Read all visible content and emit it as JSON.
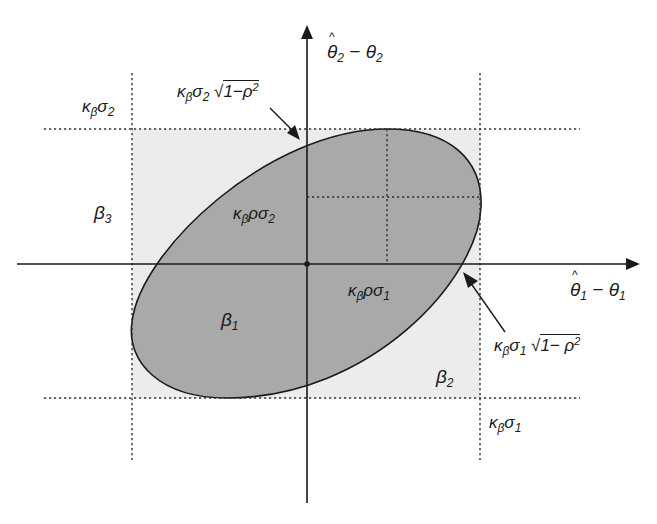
{
  "diagram": {
    "type": "confidence-ellipse-and-box",
    "colors": {
      "ellipse_fill": "#a9a9a9",
      "box_fill": "#ececec",
      "axis": "#1a1a1a",
      "dotted": "#333333"
    },
    "axes": {
      "x_label": {
        "main": "θ",
        "sub1": "1",
        "minus": " − θ",
        "sub2": "1"
      },
      "y_label": {
        "main": "θ",
        "sub1": "2",
        "minus": " − θ",
        "sub2": "2"
      }
    },
    "labels": {
      "top_left_bound": {
        "k": "κ",
        "ksub": "β",
        "s": "σ",
        "ssub": "2"
      },
      "bottom_right_bound": {
        "k": "κ",
        "ksub": "β",
        "s": "σ",
        "ssub": "1"
      },
      "top_tangent": {
        "k": "κ",
        "ksub": "β",
        "s": "σ",
        "ssub": "2",
        "sqrt_text": "1−ρ",
        "sup": "2"
      },
      "right_tangent": {
        "k": "κ",
        "ksub": "β",
        "s": "σ",
        "ssub": "1",
        "sqrt_text": "1− ρ",
        "sup": "2"
      },
      "inner_vertical": {
        "k": "κ",
        "ksub": "β",
        "rest": "ρσ",
        "ssub": "2"
      },
      "inner_horizontal": {
        "k": "κ",
        "ksub": "β",
        "rest": "ρσ",
        "ssub": "1"
      },
      "region_beta1": {
        "b": "β",
        "sub": "1"
      },
      "region_beta2": {
        "b": "β",
        "sub": "2"
      },
      "region_beta3": {
        "b": "β",
        "sub": "3"
      }
    }
  }
}
